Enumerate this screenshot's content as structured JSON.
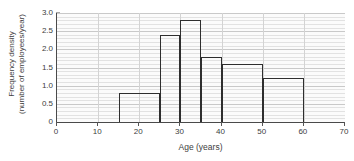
{
  "chart_data": {
    "type": "bar",
    "title": "",
    "subtitle": "",
    "xlabel": "Age (years)",
    "ylabel": "Frequency density (number of employees/year)",
    "ylabel_lines": [
      "Frequency density",
      "(number of employees/year)"
    ],
    "xlim": [
      0,
      70
    ],
    "ylim": [
      0,
      3.0
    ],
    "xticks": [
      0,
      10,
      20,
      30,
      40,
      50,
      60,
      70
    ],
    "xtick_labels": [
      "0",
      "10",
      "20",
      "30",
      "40",
      "50",
      "60",
      "70"
    ],
    "yticks": [
      0,
      0.5,
      1.0,
      1.5,
      2.0,
      2.5,
      3.0
    ],
    "ytick_labels": [
      "0",
      "0.5",
      "1.0",
      "1.5",
      "2.0",
      "2.5",
      "3.0"
    ],
    "grid": true,
    "grid_minor_y_step": 0.1,
    "grid_major_y_step": 0.5,
    "grid_vertical_step": 10,
    "legend": null,
    "legend_position": "none",
    "bin_edges": [
      15,
      25,
      30,
      35,
      40,
      50,
      60
    ],
    "bins": [
      {
        "label": "15-25",
        "x0": 15,
        "x1": 25,
        "value": 0.8
      },
      {
        "label": "25-30",
        "x0": 25,
        "x1": 30,
        "value": 2.4
      },
      {
        "label": "30-35",
        "x0": 30,
        "x1": 35,
        "value": 2.8
      },
      {
        "label": "35-40",
        "x0": 35,
        "x1": 40,
        "value": 1.8
      },
      {
        "label": "40-50",
        "x0": 40,
        "x1": 50,
        "value": 1.6
      },
      {
        "label": "50-60",
        "x0": 50,
        "x1": 60,
        "value": 1.2
      }
    ],
    "categories": [
      "15-25",
      "25-30",
      "30-35",
      "35-40",
      "40-50",
      "50-60"
    ],
    "values": [
      0.8,
      2.4,
      2.8,
      1.8,
      1.6,
      1.2
    ],
    "colors": {
      "bar_outline": "#2e2e2e",
      "bar_fill": "transparent",
      "axis": "#4a4a4a",
      "grid_minor": "#e2e2e2",
      "grid_major": "#c9c9c9",
      "plot_background": "#fbfbfb",
      "text": "#3d3d3d"
    }
  }
}
